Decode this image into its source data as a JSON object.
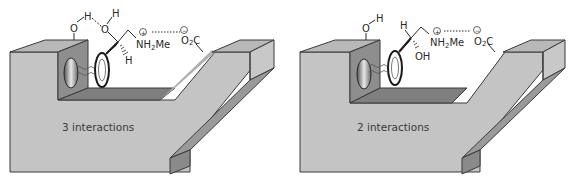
{
  "panels": [
    {
      "id": "left",
      "caption": "3 interactions",
      "labels": {
        "phenol_O": "O",
        "phenol_H": "H",
        "hydroxyl_O": "O",
        "hydroxyl_H": "H",
        "chiral_H": "H",
        "amine": "NH",
        "amine_sub": "2",
        "amine_me": "Me",
        "plus": "+",
        "carboxylate": "O",
        "carboxylate_sub": "2",
        "carboxylate_c": "C",
        "minus": "−"
      },
      "interactions": [
        "hydrogen bond (phenol OH ··· hydroxyl O)",
        "van der Waals (aromatic ring)",
        "ionic (NH2Me+ ··· CO2−)"
      ]
    },
    {
      "id": "right",
      "caption": "2 interactions",
      "labels": {
        "phenol_O": "O",
        "phenol_H": "H",
        "chiral_H": "H",
        "hydroxyl": "OH",
        "amine": "NH",
        "amine_sub": "2",
        "amine_me": "Me",
        "plus": "+",
        "carboxylate": "O",
        "carboxylate_sub": "2",
        "carboxylate_c": "C",
        "minus": "−"
      },
      "interactions": [
        "van der Waals (aromatic ring)",
        "ionic (NH2Me+ ··· CO2−)"
      ]
    }
  ],
  "colors": {
    "block_face": "#c4c4c4",
    "block_top": "#b0b0b0",
    "block_side": "#9a9a9a",
    "pocket_face": "#8e8e8e",
    "floor": "#7f7f7f",
    "edge": "#3a3a3a",
    "text": "#2a2a2a"
  }
}
